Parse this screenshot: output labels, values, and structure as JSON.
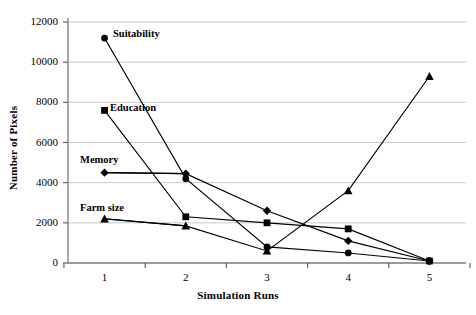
{
  "chart_data": {
    "type": "line",
    "title": "",
    "xlabel": "Simulation Runs",
    "ylabel": "Number of Pixels",
    "x": [
      1,
      2,
      3,
      4,
      5
    ],
    "categories": [
      "1",
      "2",
      "3",
      "4",
      "5"
    ],
    "xlim": [
      0.55,
      5.45
    ],
    "ylim": [
      0,
      12000
    ],
    "ytick_labels": [
      "0",
      "2000",
      "4000",
      "6000",
      "8000",
      "10000",
      "12000"
    ],
    "yticks": [
      0,
      2000,
      4000,
      6000,
      8000,
      10000,
      12000
    ],
    "grid": "horizontal",
    "legend": "inline-labels",
    "series": [
      {
        "name": "Suitability",
        "marker": "circle",
        "color": "#000000",
        "values": [
          11200,
          4200,
          800,
          500,
          100
        ]
      },
      {
        "name": "Education",
        "marker": "square",
        "color": "#000000",
        "values": [
          7600,
          2300,
          2000,
          1700,
          100
        ]
      },
      {
        "name": "Memory",
        "marker": "diamond",
        "color": "#000000",
        "values": [
          4500,
          4450,
          2600,
          1100,
          100
        ]
      },
      {
        "name": "Farm size",
        "marker": "triangle",
        "color": "#000000",
        "values": [
          2200,
          1850,
          600,
          3600,
          9300
        ]
      }
    ]
  }
}
